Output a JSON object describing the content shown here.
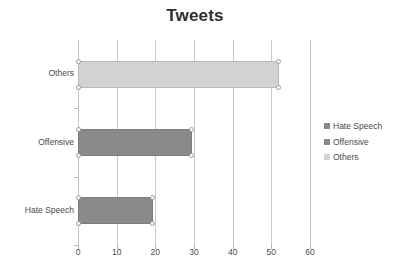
{
  "chart_data": {
    "type": "bar",
    "orientation": "horizontal",
    "title": "Tweets",
    "xlabel": "",
    "ylabel": "",
    "categories": [
      "Hate Speech",
      "Offensive",
      "Others"
    ],
    "values": [
      19.3,
      29.5,
      52.0
    ],
    "series": [
      {
        "name": "Hate Speech",
        "value": 19.3,
        "color": "#8a8a8a"
      },
      {
        "name": "Offensive",
        "value": 29.5,
        "color": "#8a8a8a"
      },
      {
        "name": "Others",
        "value": 52.0,
        "color": "#d2d2d2"
      }
    ],
    "xlim": [
      0,
      60
    ],
    "xticks": [
      0,
      10,
      20,
      30,
      40,
      50,
      60
    ],
    "xtick_labels": [
      "0",
      "10",
      "20",
      "30",
      "40",
      "50",
      "60"
    ],
    "grid": "vertical",
    "legend_position": "right",
    "legend": [
      "Hate Speech",
      "Offensive",
      "Others"
    ]
  },
  "colors": {
    "bar_dark": "#8a8a8a",
    "bar_light": "#d2d2d2",
    "gridline": "#c9c9c9",
    "axis": "#a6a6a6",
    "text": "#4a4a4a",
    "title": "#2f2f2f",
    "background": "#ffffff"
  },
  "legend": {
    "items": [
      {
        "label": "Hate Speech",
        "color": "#8a8a8a"
      },
      {
        "label": "Offensive",
        "color": "#8a8a8a"
      },
      {
        "label": "Others",
        "color": "#d2d2d2"
      }
    ]
  }
}
